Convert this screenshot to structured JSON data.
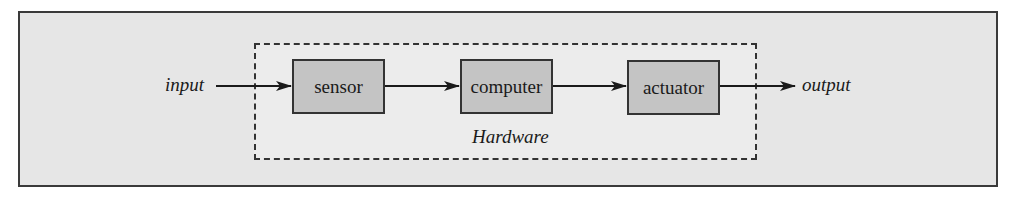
{
  "diagram": {
    "type": "block-diagram",
    "input_label": "input",
    "output_label": "output",
    "group_label": "Hardware",
    "blocks": [
      {
        "id": "sensor",
        "label": "sensor"
      },
      {
        "id": "computer",
        "label": "computer"
      },
      {
        "id": "actuator",
        "label": "actuator"
      }
    ],
    "edges": [
      {
        "from": "input",
        "to": "sensor"
      },
      {
        "from": "sensor",
        "to": "computer"
      },
      {
        "from": "computer",
        "to": "actuator"
      },
      {
        "from": "actuator",
        "to": "output"
      }
    ],
    "colors": {
      "frame_bg": "#e6e6e6",
      "group_bg": "#ececec",
      "block_fill": "#c4c4c4",
      "stroke": "#333333"
    }
  }
}
